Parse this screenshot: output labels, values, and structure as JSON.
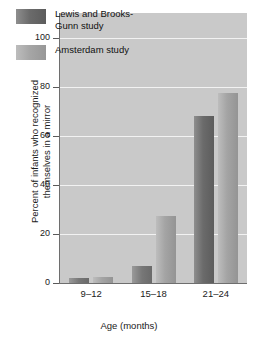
{
  "chart_data": {
    "type": "bar",
    "title": "",
    "subtitle": "",
    "xlabel": "Age (months)",
    "ylabel": "Percent of infants who recognized\nthemselves in a mirror",
    "ylabel_line1": "Percent of infants who recognized",
    "ylabel_line2": "themselves in a mirror",
    "categories": [
      "9–12",
      "15–18",
      "21–24"
    ],
    "yticks": [
      0,
      20,
      40,
      60,
      80,
      100
    ],
    "ytick_labels": [
      "0",
      "20",
      "40",
      "60",
      "80",
      "100"
    ],
    "ylim": [
      0,
      110
    ],
    "grid": "horizontal",
    "legend_position": "upper-left-inside",
    "series": [
      {
        "name": "Lewis and Brooks-Gunn study",
        "label_line1": "Lewis and Brooks-",
        "label_line2": "Gunn study",
        "color": "#6b6b6b",
        "values": [
          2,
          7,
          68
        ]
      },
      {
        "name": "Amsterdam study",
        "label_line1": "Amsterdam study",
        "label_line2": "",
        "color": "#a4a4a4",
        "values": [
          2.5,
          27.5,
          77.5
        ]
      }
    ],
    "plot_background": "#c9c9c9",
    "gridline_color": "#f2f2f2",
    "axis_color": "#6e6e6e"
  }
}
